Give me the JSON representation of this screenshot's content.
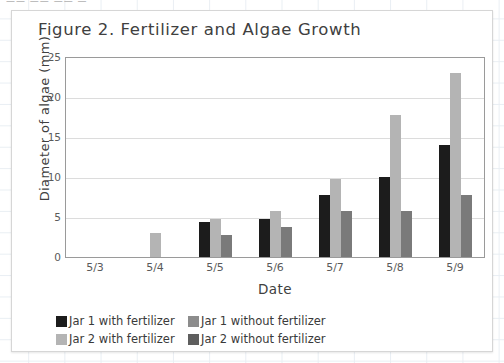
{
  "chart_data": {
    "type": "bar",
    "title": "Figure 2. Fertilizer and Algae Growth",
    "xlabel": "Date",
    "ylabel": "Diameter of algae (mm)",
    "categories": [
      "5/3",
      "5/4",
      "5/5",
      "5/6",
      "5/7",
      "5/8",
      "5/9"
    ],
    "ylim": [
      0,
      25
    ],
    "yticks": [
      0,
      5,
      10,
      15,
      20,
      25
    ],
    "grid": true,
    "legend_position": "bottom",
    "series": [
      {
        "name": "Jar 1 with fertilizer",
        "color": "#1c1c1c",
        "values": [
          0,
          0,
          4.4,
          4.7,
          7.7,
          10.0,
          14.0
        ]
      },
      {
        "name": "Jar 2 with fertilizer",
        "color": "#b4b4b4",
        "values": [
          0,
          3.0,
          4.8,
          5.8,
          9.8,
          17.8,
          23.0
        ]
      },
      {
        "name": "Jar 1 without fertilizer",
        "color": "#8c8c8c",
        "values": [
          0,
          0,
          0,
          0,
          0,
          0,
          0
        ]
      },
      {
        "name": "Jar 2 without fertilizer",
        "color": "#7a7a7a",
        "values": [
          0,
          0,
          2.7,
          3.8,
          5.7,
          5.7,
          7.8
        ]
      }
    ]
  },
  "legend": {
    "row1": [
      {
        "label": "Jar 1 with fertilizer",
        "color": "#1c1c1c"
      },
      {
        "label": "Jar 1 without fertilizer",
        "color": "#8c8c8c"
      }
    ],
    "row2": [
      {
        "label": "Jar 2 with fertilizer",
        "color": "#b4b4b4"
      },
      {
        "label": "Jar 2 without fertilizer",
        "color": "#5e5e5e"
      }
    ]
  },
  "clipped_top_text": "——  ——  —— —"
}
